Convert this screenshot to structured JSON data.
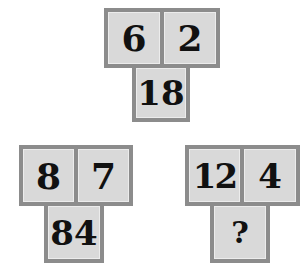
{
  "puzzle": {
    "groups": [
      {
        "top_left": "6",
        "top_right": "2",
        "bottom": "18"
      },
      {
        "top_left": "8",
        "top_right": "7",
        "bottom": "84"
      },
      {
        "top_left": "12",
        "top_right": "4",
        "bottom": "?"
      }
    ],
    "colors": {
      "border": "#8c8c8c",
      "cell": "#d9d9d9",
      "text": "#111111"
    }
  }
}
